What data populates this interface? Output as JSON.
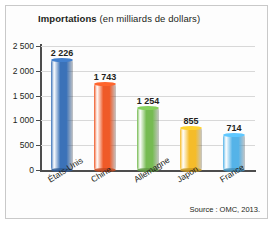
{
  "figure": {
    "title_main": "Importations",
    "title_sub": "(en milliards de dollars)",
    "source": "Source : OMC, 2013."
  },
  "chart_data": {
    "type": "bar",
    "title": "Importations (en milliards de dollars)",
    "xlabel": "",
    "ylabel": "",
    "ylim": [
      0,
      2500
    ],
    "yticks": [
      0,
      500,
      1000,
      1500,
      2000,
      2500
    ],
    "ytick_labels": [
      "0",
      "500",
      "1 000",
      "1 500",
      "2 000",
      "2 500"
    ],
    "grid": true,
    "legend": "none",
    "categories": [
      "États-Unis",
      "Chine",
      "Allemagne",
      "Japon",
      "France"
    ],
    "values": [
      2226,
      1743,
      1254,
      855,
      714
    ],
    "value_labels": [
      "2 226",
      "1 743",
      "1 254",
      "855",
      "714"
    ],
    "colors": [
      "#3b72b8",
      "#ef5a28",
      "#76bb52",
      "#f5bc2a",
      "#55b3e8"
    ],
    "annotations": [
      "Source : OMC, 2013."
    ]
  }
}
